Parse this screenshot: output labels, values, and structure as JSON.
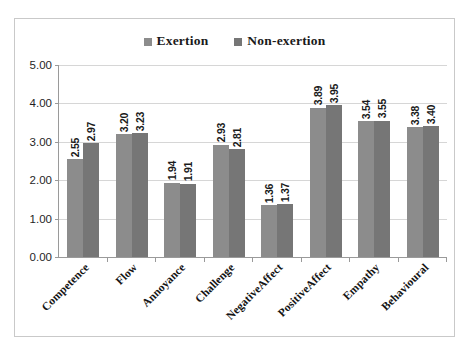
{
  "chart_data": {
    "type": "bar",
    "title": "",
    "subtitle": "",
    "xlabel": "",
    "ylabel": "",
    "ylim": [
      0,
      5
    ],
    "ytick_step": 1,
    "ytick_labels": [
      "0.00",
      "1.00",
      "2.00",
      "3.00",
      "4.00",
      "5.00"
    ],
    "grid": true,
    "legend_position": "top-center",
    "categories": [
      "Competence",
      "Flow",
      "Annoyance",
      "Challenge",
      "NegativeAffect",
      "PositiveAffect",
      "Empathy",
      "Behavioural"
    ],
    "series": [
      {
        "name": "Exertion",
        "color": "#8c8c8c",
        "values": [
          2.55,
          3.2,
          1.94,
          2.93,
          1.36,
          3.89,
          3.54,
          3.38
        ],
        "labels": [
          "2.55",
          "3.20",
          "1.94",
          "2.93",
          "1.36",
          "3.89",
          "3.54",
          "3.38"
        ]
      },
      {
        "name": "Non-exertion",
        "color": "#767676",
        "values": [
          2.97,
          3.23,
          1.91,
          2.81,
          1.37,
          3.95,
          3.55,
          3.4
        ],
        "labels": [
          "2.97",
          "3.23",
          "1.91",
          "2.81",
          "1.37",
          "3.95",
          "3.55",
          "3.40"
        ]
      }
    ]
  },
  "legend": {
    "items": [
      {
        "label": "Exertion",
        "color": "#8c8c8c"
      },
      {
        "label": "Non-exertion",
        "color": "#767676"
      }
    ]
  },
  "colors": {
    "series_1": "#8c8c8c",
    "series_2": "#767676",
    "gridline": "#d6d6d6",
    "axis": "#9a9a9a",
    "frame_border": "#c9c9c9",
    "text": "#1a1a1a",
    "background": "#ffffff"
  }
}
